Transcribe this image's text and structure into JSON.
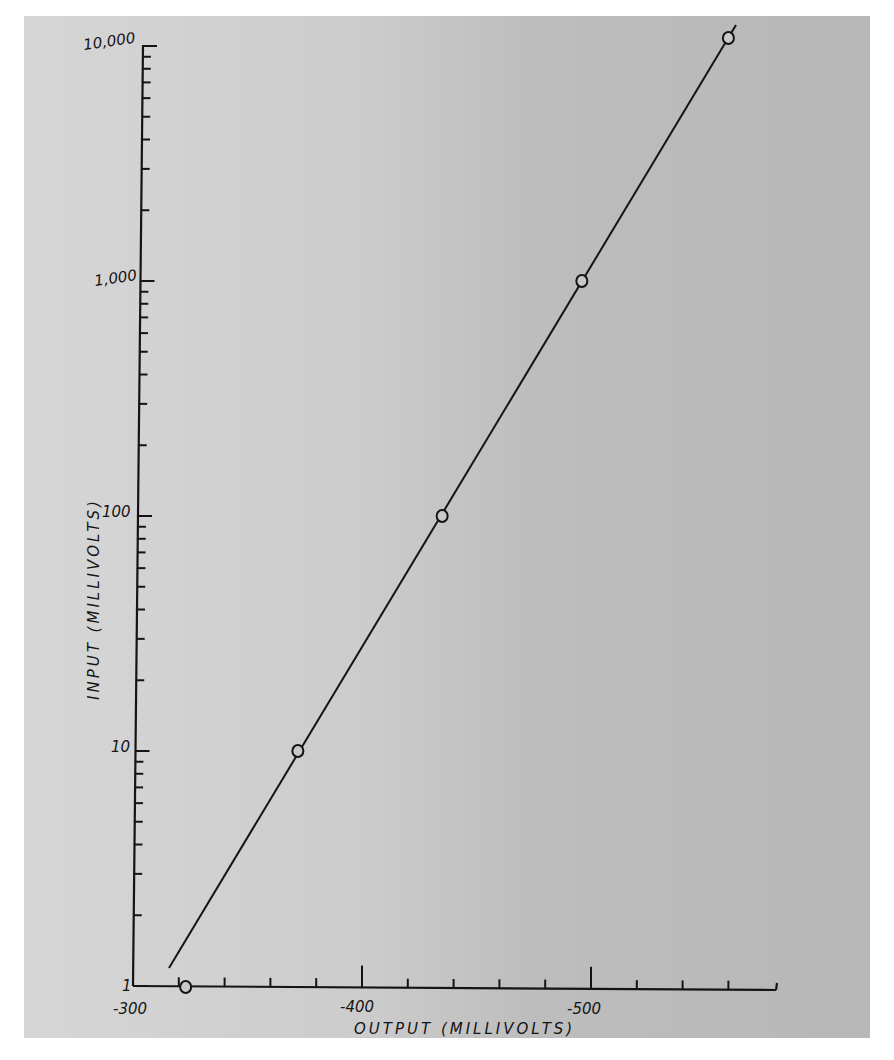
{
  "chart_data": {
    "type": "line",
    "title": "",
    "xlabel": "OUTPUT (MILLIVOLTS)",
    "ylabel": "INPUT (MILLIVOLTS)",
    "xlim": [
      -300,
      -580
    ],
    "ylim": [
      1,
      10000
    ],
    "yscale": "log",
    "grid": false,
    "x_tick_labels": [
      "-300",
      "-400",
      "-500"
    ],
    "y_tick_labels": [
      "1",
      "10",
      "100",
      "1,000",
      "10,000"
    ],
    "series": [
      {
        "name": "measured",
        "marker": "open-circle",
        "x": [
          -323,
          -372,
          -435,
          -496,
          -560
        ],
        "y": [
          1,
          10,
          100,
          1000,
          10000
        ]
      }
    ],
    "fit_line": {
      "from": [
        -316,
        1.2
      ],
      "to": [
        -564,
        11500
      ]
    }
  },
  "labels": {
    "xlabel": "OUTPUT (MILLIVOLTS)",
    "ylabel": "INPUT (MILLIVOLTS)",
    "x_ticks": [
      "-300",
      "-400",
      "-500"
    ],
    "y_ticks": [
      "1",
      "10",
      "100",
      "1,000",
      "10,000"
    ]
  },
  "colors": {
    "ink": "#141414",
    "paper_left": "#d6d6d6",
    "paper_right": "#b7b7b7"
  }
}
